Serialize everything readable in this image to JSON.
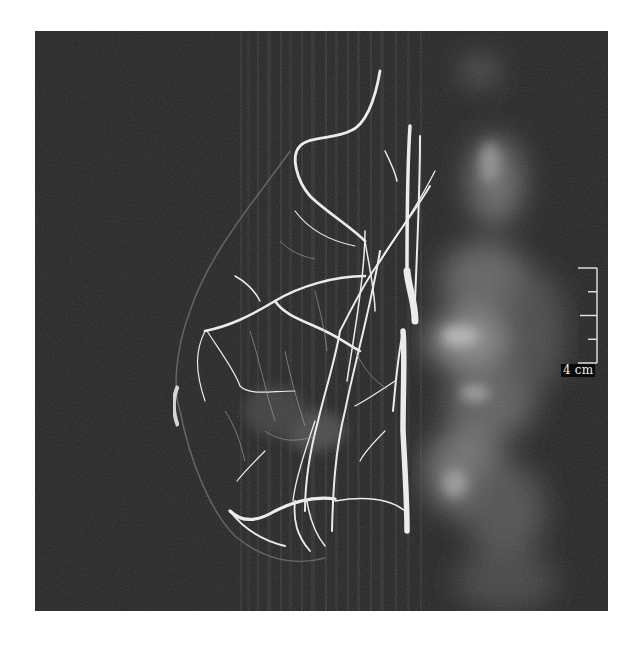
{
  "figure": {
    "background_color": "#262626",
    "vessel_color": "#f2f2f2",
    "tissue_glow_color": "#9a9a9a"
  },
  "scale_bar": {
    "label": "4 cm",
    "ticks": 5,
    "color": "#e6e6e6"
  }
}
